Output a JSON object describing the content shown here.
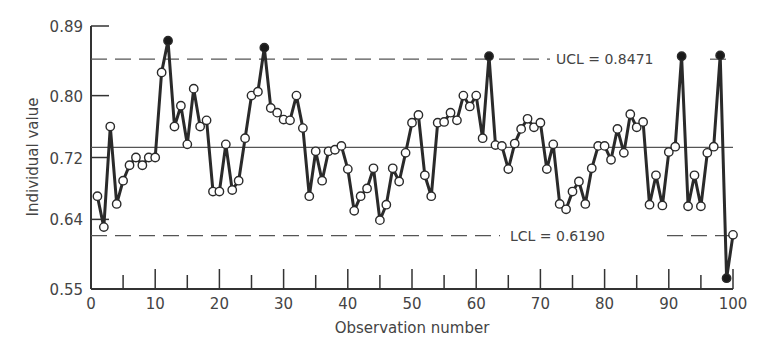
{
  "chart_data": {
    "type": "line",
    "title": "",
    "xlabel": "Observation number",
    "ylabel": "Individual value",
    "xlim": [
      0,
      100
    ],
    "ylim": [
      0.55,
      0.89
    ],
    "x_ticks": [
      0,
      10,
      20,
      30,
      40,
      50,
      60,
      70,
      80,
      90,
      100
    ],
    "x_minor_ticks": [
      5,
      15,
      25,
      35,
      45,
      55,
      65,
      75,
      85,
      95
    ],
    "y_ticks": [
      0.55,
      0.64,
      0.72,
      0.8,
      0.89
    ],
    "y_tick_labels": [
      "0.55",
      "0.64",
      "0.72",
      "0.80",
      "0.89"
    ],
    "grid": false,
    "legend": null,
    "center_line": 0.733,
    "ucl": {
      "value": 0.8471,
      "label": "UCL = 0.8471"
    },
    "lcl": {
      "value": 0.619,
      "label": "LCL = 0.6190"
    },
    "series": [
      {
        "name": "Individual value",
        "x": [
          1,
          2,
          3,
          4,
          5,
          6,
          7,
          8,
          9,
          10,
          11,
          12,
          13,
          14,
          15,
          16,
          17,
          18,
          19,
          20,
          21,
          22,
          23,
          24,
          25,
          26,
          27,
          28,
          29,
          30,
          31,
          32,
          33,
          34,
          35,
          36,
          37,
          38,
          39,
          40,
          41,
          42,
          43,
          44,
          45,
          46,
          47,
          48,
          49,
          50,
          51,
          52,
          53,
          54,
          55,
          56,
          57,
          58,
          59,
          60,
          61,
          62,
          63,
          64,
          65,
          66,
          67,
          68,
          69,
          70,
          71,
          72,
          73,
          74,
          75,
          76,
          77,
          78,
          79,
          80,
          81,
          82,
          83,
          84,
          85,
          86,
          87,
          88,
          89,
          90,
          91,
          92,
          93,
          94,
          95,
          96,
          97,
          98,
          99,
          100
        ],
        "values": [
          0.67,
          0.63,
          0.76,
          0.66,
          0.69,
          0.71,
          0.72,
          0.71,
          0.72,
          0.72,
          0.83,
          0.871,
          0.76,
          0.787,
          0.737,
          0.809,
          0.76,
          0.768,
          0.676,
          0.676,
          0.737,
          0.678,
          0.69,
          0.745,
          0.8,
          0.805,
          0.862,
          0.784,
          0.778,
          0.769,
          0.768,
          0.8,
          0.758,
          0.67,
          0.728,
          0.69,
          0.728,
          0.73,
          0.735,
          0.705,
          0.651,
          0.67,
          0.68,
          0.706,
          0.639,
          0.659,
          0.706,
          0.689,
          0.726,
          0.765,
          0.775,
          0.697,
          0.67,
          0.765,
          0.766,
          0.778,
          0.768,
          0.8,
          0.786,
          0.8,
          0.745,
          0.851,
          0.736,
          0.735,
          0.705,
          0.738,
          0.757,
          0.77,
          0.759,
          0.765,
          0.705,
          0.737,
          0.66,
          0.653,
          0.676,
          0.689,
          0.66,
          0.706,
          0.735,
          0.735,
          0.717,
          0.757,
          0.726,
          0.776,
          0.759,
          0.766,
          0.659,
          0.697,
          0.658,
          0.727,
          0.734,
          0.851,
          0.657,
          0.697,
          0.657,
          0.726,
          0.734,
          0.852,
          0.564,
          0.62
        ],
        "out_of_control_points": [
          12,
          27,
          62,
          92,
          98,
          99
        ]
      }
    ]
  }
}
